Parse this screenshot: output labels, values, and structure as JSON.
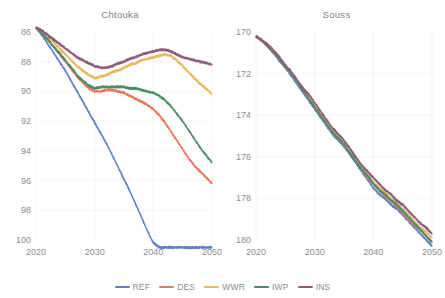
{
  "figure": {
    "background": "#ffffff",
    "axis_text_color": "#8c8c8c",
    "title_color": "#808080",
    "gridline_color": "#f0f0f0"
  },
  "legend": {
    "position": "bottom-center",
    "entries": [
      {
        "label": "REF",
        "color": "#5b7fc7",
        "swatch_name": "legend-swatch-ref"
      },
      {
        "label": "DES",
        "color": "#e8765a",
        "swatch_name": "legend-swatch-des"
      },
      {
        "label": "WWR",
        "color": "#e8b85a",
        "swatch_name": "legend-swatch-wwr"
      },
      {
        "label": "IWP",
        "color": "#4a8c6a",
        "swatch_name": "legend-swatch-iwp"
      },
      {
        "label": "INS",
        "color": "#8c5a7a",
        "swatch_name": "legend-swatch-ins"
      }
    ]
  },
  "panels": [
    {
      "id": "chtouka",
      "title": "Chtouka"
    },
    {
      "id": "souss",
      "title": "Souss"
    }
  ],
  "chart_data": [
    {
      "type": "line",
      "title": "Chtouka",
      "xlabel": "",
      "ylabel": "",
      "xlim": [
        2020,
        2050
      ],
      "ylim": [
        86,
        100
      ],
      "y_inverted": true,
      "grid": true,
      "legend": "bottom",
      "xticks": [
        2020,
        2030,
        2040,
        2050
      ],
      "yticks": [
        86,
        88,
        90,
        92,
        94,
        96,
        98,
        100
      ],
      "x": [
        2020,
        2021,
        2022,
        2023,
        2024,
        2025,
        2026,
        2027,
        2028,
        2029,
        2030,
        2031,
        2032,
        2033,
        2034,
        2035,
        2036,
        2037,
        2038,
        2039,
        2040,
        2041,
        2042,
        2043,
        2044,
        2045,
        2046,
        2047,
        2048,
        2049,
        2050
      ],
      "series": [
        {
          "name": "REF",
          "color": "#5b7fc7",
          "values": [
            85.7,
            86.2,
            86.8,
            87.4,
            88.0,
            88.6,
            89.3,
            90.0,
            90.7,
            91.4,
            92.1,
            92.8,
            93.5,
            94.3,
            95.1,
            95.9,
            96.7,
            97.6,
            98.5,
            99.4,
            100.2,
            100.5,
            100.5,
            100.5,
            100.5,
            100.5,
            100.5,
            100.5,
            100.5,
            100.5,
            100.5
          ]
        },
        {
          "name": "DES",
          "color": "#e8765a",
          "values": [
            85.7,
            86.1,
            86.5,
            87.0,
            87.5,
            88.0,
            88.5,
            89.0,
            89.4,
            89.8,
            90.0,
            90.0,
            89.9,
            89.9,
            90.0,
            90.1,
            90.3,
            90.5,
            90.7,
            90.9,
            91.2,
            91.6,
            92.1,
            92.7,
            93.3,
            93.9,
            94.5,
            95.0,
            95.4,
            95.8,
            96.2
          ]
        },
        {
          "name": "WWR",
          "color": "#e8b85a",
          "values": [
            85.7,
            86.0,
            86.3,
            86.7,
            87.1,
            87.5,
            87.9,
            88.3,
            88.6,
            88.9,
            89.1,
            89.0,
            88.9,
            88.7,
            88.6,
            88.4,
            88.2,
            88.1,
            87.9,
            87.8,
            87.7,
            87.6,
            87.5,
            87.6,
            87.9,
            88.3,
            88.7,
            89.1,
            89.5,
            89.8,
            90.2
          ]
        },
        {
          "name": "IWP",
          "color": "#4a8c6a",
          "values": [
            85.7,
            86.1,
            86.5,
            87.0,
            87.4,
            87.9,
            88.4,
            88.9,
            89.3,
            89.6,
            89.8,
            89.7,
            89.7,
            89.7,
            89.7,
            89.7,
            89.8,
            89.8,
            89.9,
            90.0,
            90.1,
            90.3,
            90.6,
            91.0,
            91.5,
            92.0,
            92.6,
            93.2,
            93.8,
            94.3,
            94.8
          ]
        },
        {
          "name": "INS",
          "color": "#8c5a7a",
          "values": [
            85.7,
            85.9,
            86.2,
            86.5,
            86.8,
            87.1,
            87.4,
            87.7,
            87.9,
            88.1,
            88.3,
            88.4,
            88.4,
            88.3,
            88.1,
            88.0,
            87.8,
            87.7,
            87.5,
            87.4,
            87.3,
            87.2,
            87.2,
            87.3,
            87.5,
            87.7,
            87.8,
            87.9,
            88.0,
            88.1,
            88.2
          ]
        }
      ]
    },
    {
      "type": "line",
      "title": "Souss",
      "xlabel": "",
      "ylabel": "",
      "xlim": [
        2020,
        2050
      ],
      "ylim": [
        170,
        180
      ],
      "y_inverted": true,
      "grid": true,
      "legend": "bottom",
      "xticks": [
        2020,
        2030,
        2040,
        2050
      ],
      "yticks": [
        170,
        172,
        174,
        176,
        178,
        180
      ],
      "x": [
        2020,
        2021,
        2022,
        2023,
        2024,
        2025,
        2026,
        2027,
        2028,
        2029,
        2030,
        2031,
        2032,
        2033,
        2034,
        2035,
        2036,
        2037,
        2038,
        2039,
        2040,
        2041,
        2042,
        2043,
        2044,
        2045,
        2046,
        2047,
        2048,
        2049,
        2050
      ],
      "series": [
        {
          "name": "REF",
          "color": "#5b7fc7",
          "values": [
            170.2,
            170.4,
            170.7,
            171.0,
            171.4,
            171.7,
            172.1,
            172.5,
            172.9,
            173.3,
            173.7,
            174.1,
            174.5,
            174.9,
            175.2,
            175.5,
            175.9,
            176.3,
            176.7,
            177.1,
            177.5,
            177.8,
            178.0,
            178.3,
            178.5,
            178.8,
            179.1,
            179.4,
            179.7,
            180.0,
            180.3
          ]
        },
        {
          "name": "DES",
          "color": "#e8765a",
          "values": [
            170.2,
            170.4,
            170.7,
            171.0,
            171.3,
            171.7,
            172.0,
            172.4,
            172.8,
            173.2,
            173.6,
            174.0,
            174.4,
            174.8,
            175.1,
            175.4,
            175.8,
            176.2,
            176.6,
            177.0,
            177.3,
            177.6,
            177.9,
            178.1,
            178.4,
            178.7,
            179.0,
            179.3,
            179.5,
            179.8,
            180.1
          ]
        },
        {
          "name": "WWR",
          "color": "#e8b85a",
          "values": [
            170.2,
            170.4,
            170.6,
            170.9,
            171.3,
            171.6,
            172.0,
            172.3,
            172.7,
            173.1,
            173.5,
            173.9,
            174.3,
            174.7,
            175.0,
            175.3,
            175.7,
            176.1,
            176.5,
            176.8,
            177.2,
            177.5,
            177.7,
            178.0,
            178.2,
            178.5,
            178.8,
            179.1,
            179.4,
            179.6,
            179.9
          ]
        },
        {
          "name": "IWP",
          "color": "#4a8c6a",
          "values": [
            170.2,
            170.4,
            170.7,
            171.0,
            171.3,
            171.7,
            172.0,
            172.4,
            172.8,
            173.2,
            173.6,
            174.0,
            174.4,
            174.8,
            175.1,
            175.4,
            175.8,
            176.2,
            176.6,
            176.9,
            177.3,
            177.6,
            177.8,
            178.1,
            178.3,
            178.6,
            178.9,
            179.2,
            179.5,
            179.8,
            180.1
          ]
        },
        {
          "name": "INS",
          "color": "#8c5a7a",
          "values": [
            170.2,
            170.4,
            170.6,
            170.9,
            171.2,
            171.6,
            171.9,
            172.3,
            172.7,
            173.0,
            173.4,
            173.8,
            174.2,
            174.6,
            174.9,
            175.2,
            175.6,
            176.0,
            176.4,
            176.7,
            177.0,
            177.3,
            177.6,
            177.8,
            178.1,
            178.3,
            178.6,
            178.9,
            179.2,
            179.4,
            179.7
          ]
        }
      ]
    }
  ]
}
